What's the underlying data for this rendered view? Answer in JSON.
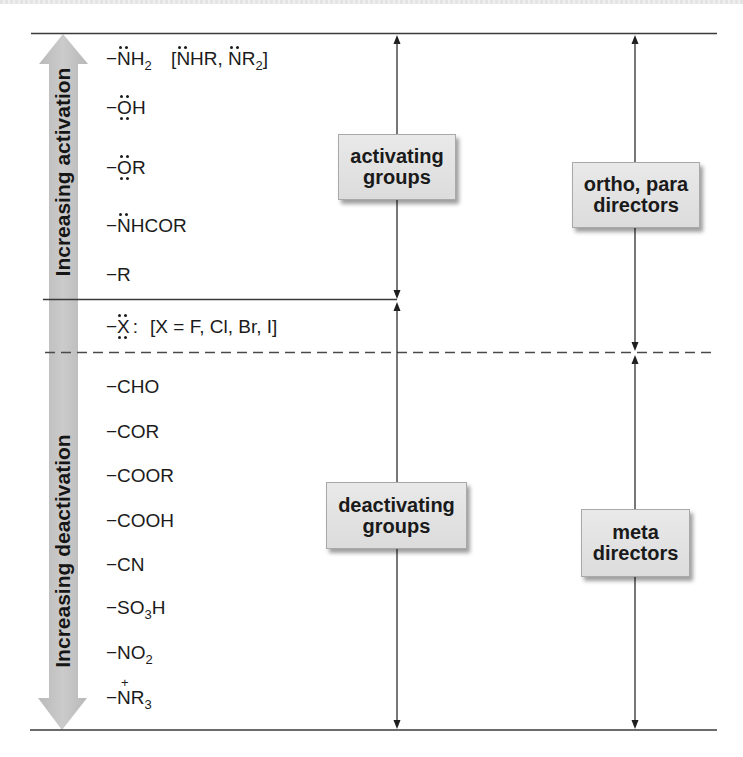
{
  "scales": {
    "activation": {
      "label": "Increasing activation"
    },
    "deactivation": {
      "label": "Increasing deactivation"
    }
  },
  "activating_groups": {
    "box": {
      "line1": "activating",
      "line2": "groups"
    },
    "items": [
      {
        "dash": "−",
        "atom": "N",
        "tail": "H",
        "sub": "2",
        "alt": {
          "open": "[",
          "atom1": "N",
          "tail1": "HR, ",
          "atom2": "N",
          "tail2": "R",
          "sub2": "2",
          "close": "]"
        }
      },
      {
        "dash": "−",
        "atom": "O",
        "tail": "H"
      },
      {
        "dash": "−",
        "atom": "O",
        "tail": "R"
      },
      {
        "dash": "−",
        "atom": "N",
        "tail": "HCOR"
      },
      {
        "dash": "−",
        "atom": "R"
      }
    ]
  },
  "halogen": {
    "dash": "−",
    "atom": "X",
    "lone_pair": ":",
    "note": "[X = F, Cl, Br, I]"
  },
  "deactivating_groups": {
    "box": {
      "line1": "deactivating",
      "line2": "groups"
    },
    "items": [
      {
        "text": "−CHO"
      },
      {
        "text": "−COR"
      },
      {
        "text": "−COOR"
      },
      {
        "text": "−COOH"
      },
      {
        "text": "−CN"
      },
      {
        "text": "−SO",
        "sub": "3",
        "tail": "H"
      },
      {
        "text": "−NO",
        "sub": "2"
      },
      {
        "dash": "−",
        "atom": "N",
        "charge": "+",
        "tail": "R",
        "sub": "3"
      }
    ]
  },
  "directors": {
    "ortho_para": {
      "line1": "ortho, para",
      "line2": "directors"
    },
    "meta": {
      "line1": "meta",
      "line2": "directors"
    }
  },
  "colors": {
    "scale_arrow": "#bfbfbf",
    "box_fill": "#e3e3e3",
    "line": "#333333",
    "text": "#1b1b1b"
  }
}
